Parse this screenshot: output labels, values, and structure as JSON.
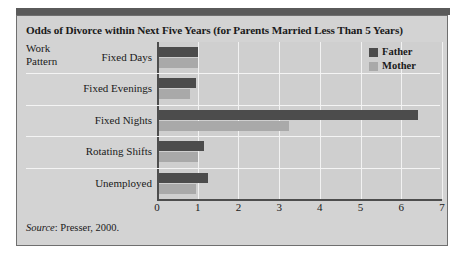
{
  "figure": {
    "title": "Odds of Divorce within Next Five Years (for Parents Married Less Than 5 Years)",
    "axis_title_line1": "Work",
    "axis_title_line2": "Pattern",
    "source_word": "Source",
    "source_rest": ": Presser, 2000.",
    "colors": {
      "father": "#4c4c4c",
      "mother": "#a9a9a9",
      "panel": "#d3d3d3",
      "plot": "#cfcfcf",
      "gridline": "#f2f2f2",
      "axis": "#4d4d4d",
      "top_bar": "#5a5a5a"
    }
  },
  "legend": {
    "items": [
      {
        "label": "Father",
        "key": "father"
      },
      {
        "label": "Mother",
        "key": "mother"
      }
    ]
  },
  "chart_data": {
    "type": "bar",
    "orientation": "horizontal",
    "title": "Odds of Divorce within Next Five Years (for Parents Married Less Than 5 Years)",
    "xlabel": "",
    "ylabel": "Work Pattern",
    "categories": [
      "Fixed Days",
      "Fixed Evenings",
      "Fixed Nights",
      "Rotating Shifts",
      "Unemployed"
    ],
    "series": [
      {
        "name": "Father",
        "values": [
          1.0,
          0.95,
          6.4,
          1.15,
          1.25
        ]
      },
      {
        "name": "Mother",
        "values": [
          1.0,
          0.82,
          3.25,
          1.0,
          0.95
        ]
      }
    ],
    "xlim": [
      0,
      7
    ],
    "xticks": [
      0,
      1,
      2,
      3,
      4,
      5,
      6,
      7
    ],
    "grid": true,
    "legend_position": "top-right",
    "annotation": "Source: Presser, 2000."
  }
}
